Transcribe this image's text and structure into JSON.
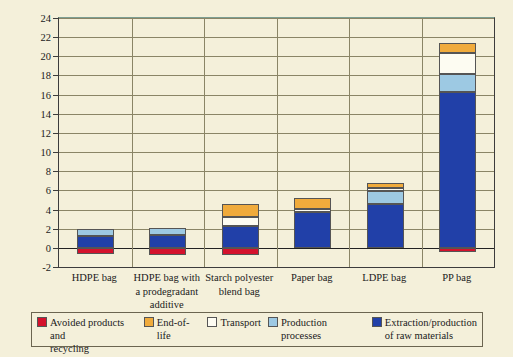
{
  "chart_data": {
    "type": "bar",
    "subtype": "stacked",
    "title": "",
    "xlabel": "",
    "ylabel": "Global warming potential (kg CO2 eq.)",
    "ylabel_html": "Global warming potential (kg CO<sub>2</sub> eq.)",
    "ylim": [
      -2,
      24
    ],
    "ytick_step": 2,
    "yticks": [
      24,
      22,
      20,
      18,
      16,
      14,
      12,
      10,
      8,
      6,
      4,
      2,
      0,
      -2
    ],
    "grid": true,
    "legend_position": "bottom",
    "categories": [
      "HDPE bag",
      "HDPE bag with a prodegradant additive",
      "Starch polyester blend bag",
      "Paper bag",
      "LDPE bag",
      "PP bag"
    ],
    "series": [
      {
        "name": "Extraction/production of raw materials",
        "color": "#2140a8",
        "values": [
          1.25,
          1.3,
          2.25,
          3.75,
          4.55,
          16.3
        ]
      },
      {
        "name": "Production processes",
        "color": "#9dc9e3",
        "values": [
          0.7,
          0.8,
          0.0,
          0.0,
          1.4,
          1.9
        ]
      },
      {
        "name": "Transport",
        "color": "#fdfcf2",
        "values": [
          0.0,
          0.0,
          1.0,
          0.3,
          0.25,
          2.1
        ]
      },
      {
        "name": "End-of-life",
        "color": "#f0ab3c",
        "values": [
          0.0,
          0.0,
          1.35,
          1.2,
          0.55,
          1.1
        ]
      },
      {
        "name": "Avoided products and recycling",
        "color": "#d4122c",
        "values": [
          -0.65,
          -0.7,
          -0.75,
          0.0,
          0.0,
          -0.4
        ]
      }
    ],
    "totals_positive": [
      1.95,
      2.1,
      4.6,
      5.25,
      6.75,
      21.4
    ],
    "legend_entries": [
      "Avoided products and recycling",
      "End-of-life",
      "Transport",
      "Production processes",
      "Extraction/production of raw materials"
    ],
    "colors": {
      "avoided": "#d4122c",
      "end_of_life": "#f0ab3c",
      "transport": "#fdfcf2",
      "production": "#9dc9e3",
      "extraction": "#2140a8",
      "background": "#f4f0da",
      "axis": "#3c3c3c",
      "grid": "#8a8566"
    }
  }
}
